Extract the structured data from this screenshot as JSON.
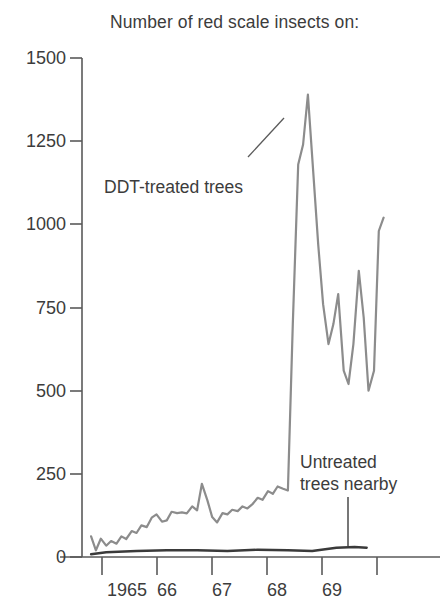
{
  "chart_data": {
    "type": "line",
    "title": "Number of red scale insects on:",
    "xlabel": "",
    "ylabel": "",
    "ylim": [
      0,
      1500
    ],
    "yticks": [
      0,
      250,
      500,
      750,
      1000,
      1250,
      1500
    ],
    "ytick_labels": [
      "0",
      "250",
      "500",
      "750",
      "1000",
      "1250",
      "1500"
    ],
    "xlim": [
      1964.6,
      1969.85
    ],
    "xticks": [
      1965,
      1966,
      1967,
      1968,
      1969
    ],
    "xtick_labels": [
      "1965",
      "66",
      "67",
      "68",
      "69"
    ],
    "minor_xticks": [
      1964.5,
      1965.5,
      1966.5,
      1967.5,
      1968.5,
      1969.5
    ],
    "grid": false,
    "legend_position": "inline-annotations",
    "annotations": [
      {
        "name": "ddt-treated-trees",
        "text": "DDT-treated trees",
        "leader": "diagonal-up-right-to-peak"
      },
      {
        "name": "untreated-trees-nearby",
        "text": "Untreated trees nearby",
        "leader": "vertical-down-to-line"
      }
    ],
    "series": [
      {
        "name": "DDT-treated trees",
        "color": "#8c8c8c",
        "x": [
          1964.75,
          1964.83,
          1964.91,
          1965.0,
          1965.08,
          1965.17,
          1965.25,
          1965.33,
          1965.42,
          1965.5,
          1965.58,
          1965.67,
          1965.75,
          1965.83,
          1965.92,
          1966.0,
          1966.08,
          1966.17,
          1966.25,
          1966.33,
          1966.42,
          1966.5,
          1966.58,
          1966.67,
          1966.75,
          1966.83,
          1966.92,
          1967.0,
          1967.08,
          1967.17,
          1967.25,
          1967.33,
          1967.42,
          1967.5,
          1967.58,
          1967.67,
          1967.75,
          1967.83,
          1967.92,
          1968.0,
          1968.08,
          1968.17,
          1968.25,
          1968.33,
          1968.42,
          1968.5,
          1968.58,
          1968.67,
          1968.75,
          1968.83,
          1968.92,
          1969.0,
          1969.08,
          1969.17,
          1969.25,
          1969.33,
          1969.42,
          1969.5,
          1969.58
        ],
        "y": [
          62,
          20,
          55,
          34,
          48,
          40,
          62,
          54,
          78,
          72,
          95,
          90,
          118,
          128,
          106,
          110,
          136,
          132,
          134,
          131,
          152,
          140,
          220,
          170,
          120,
          104,
          132,
          128,
          142,
          138,
          152,
          146,
          160,
          178,
          172,
          198,
          190,
          212,
          205,
          200,
          700,
          1180,
          1240,
          1390,
          1150,
          940,
          760,
          640,
          700,
          790,
          560,
          520,
          640,
          860,
          720,
          500,
          560,
          980,
          1020
        ]
      },
      {
        "name": "Untreated trees nearby",
        "color": "#3a3a3a",
        "x": [
          1964.75,
          1965.0,
          1965.5,
          1966.0,
          1966.5,
          1967.0,
          1967.5,
          1968.0,
          1968.4,
          1968.8,
          1969.1,
          1969.3
        ],
        "y": [
          8,
          14,
          18,
          20,
          20,
          18,
          22,
          20,
          18,
          28,
          30,
          28
        ]
      }
    ]
  },
  "title": {
    "text": "Number of red scale insects on:"
  },
  "axes": {
    "y_labels": [
      "1500",
      "1250",
      "1000",
      "750",
      "500",
      "250",
      "0"
    ],
    "x_labels": [
      "1965",
      "66",
      "67",
      "68",
      "69"
    ]
  },
  "labels": {
    "ddt": "DDT-treated trees",
    "untreated_line1": "Untreated",
    "untreated_line2": "trees nearby"
  },
  "colors": {
    "ddt_line": "#8c8c8c",
    "untreated_line": "#3a3a3a",
    "axis": "#5a5a5a",
    "text": "#3c3c3c",
    "background": "#ffffff"
  }
}
